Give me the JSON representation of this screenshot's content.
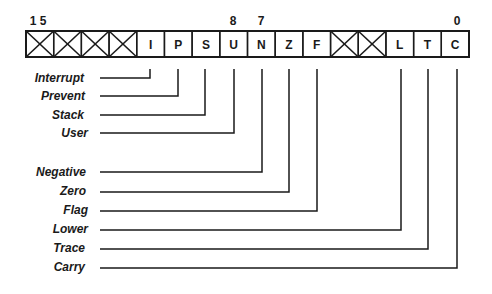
{
  "diagram": {
    "colors": {
      "ink": "#1a1a1a",
      "background": "#ffffff"
    },
    "register": {
      "bit_labels": [
        {
          "text": "1 5",
          "bit": 15
        },
        {
          "text": "8",
          "bit": 8
        },
        {
          "text": "7",
          "bit": 7
        },
        {
          "text": "0",
          "bit": 0
        }
      ],
      "cells": [
        {
          "bit": 15,
          "letter": "",
          "reserved": true
        },
        {
          "bit": 14,
          "letter": "",
          "reserved": true
        },
        {
          "bit": 13,
          "letter": "",
          "reserved": true
        },
        {
          "bit": 12,
          "letter": "",
          "reserved": true
        },
        {
          "bit": 11,
          "letter": "I",
          "reserved": false
        },
        {
          "bit": 10,
          "letter": "P",
          "reserved": false
        },
        {
          "bit": 9,
          "letter": "S",
          "reserved": false
        },
        {
          "bit": 8,
          "letter": "U",
          "reserved": false
        },
        {
          "bit": 7,
          "letter": "N",
          "reserved": false
        },
        {
          "bit": 6,
          "letter": "Z",
          "reserved": false
        },
        {
          "bit": 5,
          "letter": "F",
          "reserved": false
        },
        {
          "bit": 4,
          "letter": "",
          "reserved": true
        },
        {
          "bit": 3,
          "letter": "",
          "reserved": true
        },
        {
          "bit": 2,
          "letter": "L",
          "reserved": false
        },
        {
          "bit": 1,
          "letter": "T",
          "reserved": false
        },
        {
          "bit": 0,
          "letter": "C",
          "reserved": false
        }
      ]
    },
    "flags": [
      {
        "name": "Interrupt",
        "bit": 11
      },
      {
        "name": "Prevent",
        "bit": 10
      },
      {
        "name": "Stack",
        "bit": 9
      },
      {
        "name": "User",
        "bit": 8
      },
      {
        "name": "Negative",
        "bit": 7
      },
      {
        "name": "Zero",
        "bit": 6
      },
      {
        "name": "Flag",
        "bit": 5
      },
      {
        "name": "Lower",
        "bit": 2
      },
      {
        "name": "Trace",
        "bit": 1
      },
      {
        "name": "Carry",
        "bit": 0
      }
    ]
  }
}
